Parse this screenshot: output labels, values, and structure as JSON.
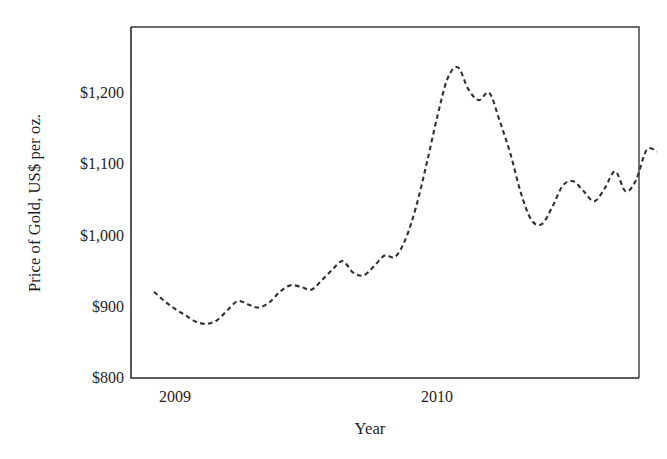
{
  "chart_data": {
    "type": "line",
    "title": "",
    "xlabel": "Year",
    "ylabel": "Price of Gold, US$ per oz.",
    "xlim": [
      2008.92,
      2010.86
    ],
    "ylim": [
      800,
      1280
    ],
    "ytick_values": [
      800,
      900,
      1000,
      1100,
      1200
    ],
    "ytick_labels": [
      "$800",
      "$900",
      "$1,000",
      "$1,100",
      "$1,200"
    ],
    "xtick_values": [
      2009,
      2010
    ],
    "xtick_labels": [
      "2009",
      "2010"
    ],
    "grid": false,
    "legend": false,
    "line_style": "dashed",
    "line_color": "#30302f",
    "background_color": "#ffffff",
    "series": [
      {
        "name": "Price of Gold",
        "x": [
          2008.92,
          2008.96,
          2009.0,
          2009.04,
          2009.08,
          2009.12,
          2009.16,
          2009.2,
          2009.24,
          2009.28,
          2009.32,
          2009.36,
          2009.4,
          2009.44,
          2009.48,
          2009.52,
          2009.56,
          2009.6,
          2009.64,
          2009.68,
          2009.72,
          2009.76,
          2009.8,
          2009.84,
          2009.88,
          2009.92,
          2009.96,
          2010.0,
          2010.04,
          2010.08,
          2010.12,
          2010.16,
          2010.2,
          2010.24,
          2010.28,
          2010.32,
          2010.36,
          2010.4,
          2010.44,
          2010.48,
          2010.52,
          2010.56,
          2010.6,
          2010.64,
          2010.68,
          2010.72,
          2010.76,
          2010.8,
          2010.84
        ],
        "y": [
          921,
          908,
          897,
          888,
          879,
          876,
          881,
          895,
          908,
          903,
          899,
          906,
          921,
          930,
          928,
          924,
          937,
          952,
          964,
          948,
          944,
          957,
          972,
          970,
          995,
          1040,
          1100,
          1165,
          1220,
          1236,
          1205,
          1190,
          1200,
          1160,
          1115,
          1060,
          1022,
          1016,
          1040,
          1070,
          1076,
          1062,
          1048,
          1066,
          1090,
          1062,
          1078,
          1120,
          1118
        ]
      }
    ],
    "annotations": [],
    "notable_points": {
      "start_value": 921,
      "first_peak": 1236,
      "mid_trough": 1016,
      "final_peak": 1262,
      "end_value": 1240,
      "minimum": 876
    }
  },
  "axes": {
    "y_axis_title": "Price of Gold, US$ per oz.",
    "x_axis_title": "Year",
    "y_tick_0": "$800",
    "y_tick_1": "$900",
    "y_tick_2": "$1,000",
    "y_tick_3": "$1,100",
    "y_tick_4": "$1,200",
    "x_tick_0": "2009",
    "x_tick_1": "2010"
  }
}
